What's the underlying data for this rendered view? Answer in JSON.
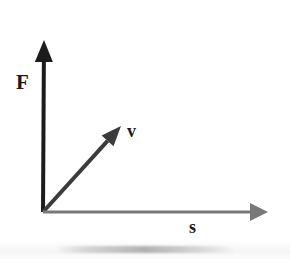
{
  "figure": {
    "background_color": "#ffffff"
  },
  "labels": {
    "force": "F",
    "velocity": "v",
    "displacement": "s"
  },
  "colors": {
    "force_axis": "#1c1c1c",
    "velocity_vector": "#3b3b3b",
    "displacement_axis": "#787878",
    "label_text": "#1a1a1a"
  },
  "chart_data": {
    "type": "scatter",
    "title": "",
    "xlabel": "s",
    "ylabel": "F",
    "grid": false,
    "legend": null,
    "origin": [
      43,
      212
    ],
    "vectors": [
      {
        "name": "F",
        "label": "F",
        "description": "Force vector drawn as the vertical axis arrow pointing up",
        "from": [
          43,
          212
        ],
        "to": [
          44,
          40
        ],
        "angle_deg": 90,
        "color": "#1c1c1c",
        "line_width": 4,
        "arrowhead": true,
        "label_position": [
          16,
          72
        ]
      },
      {
        "name": "v",
        "label": "v",
        "description": "Velocity vector drawn diagonally up and to the right from the origin",
        "from": [
          43,
          212
        ],
        "to": [
          121,
          126
        ],
        "angle_deg": 48,
        "color": "#3b3b3b",
        "line_width": 4,
        "arrowhead": true,
        "label_position": [
          127,
          122
        ]
      },
      {
        "name": "s",
        "label": "s",
        "description": "Displacement vector drawn as the horizontal axis arrow pointing right",
        "from": [
          43,
          212
        ],
        "to": [
          268,
          212
        ],
        "angle_deg": 0,
        "color": "#787878",
        "line_width": 3,
        "arrowhead": true,
        "label_position": [
          189,
          218
        ]
      }
    ]
  }
}
